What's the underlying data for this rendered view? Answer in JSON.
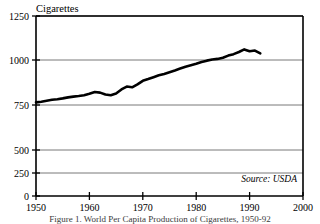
{
  "figure": {
    "title": "Cigarettes",
    "source_note": "Source: USDA",
    "caption": "Figure 1. World Per Capita Production of Cigarettes, 1950-92"
  },
  "chart_data": {
    "type": "line",
    "title": "Cigarettes",
    "xlabel": "",
    "ylabel": "Cigarettes",
    "xlim": [
      1950,
      2000
    ],
    "ylim": [
      0,
      1250
    ],
    "grid": true,
    "legend": null,
    "annotations": [
      "Source: USDA"
    ],
    "xticks": [
      1950,
      1960,
      1970,
      1980,
      1990,
      2000
    ],
    "yticks": [
      0,
      250,
      500,
      750,
      1000,
      1250
    ],
    "series": [
      {
        "name": "Cigarettes per capita",
        "x": [
          1950,
          1951,
          1952,
          1953,
          1954,
          1955,
          1956,
          1957,
          1958,
          1959,
          1960,
          1961,
          1962,
          1963,
          1964,
          1965,
          1966,
          1967,
          1968,
          1969,
          1970,
          1971,
          1972,
          1973,
          1974,
          1975,
          1976,
          1977,
          1978,
          1979,
          1980,
          1981,
          1982,
          1983,
          1984,
          1985,
          1986,
          1987,
          1988,
          1989,
          1990,
          1991,
          1992
        ],
        "values": [
          650,
          655,
          662,
          668,
          672,
          678,
          685,
          690,
          694,
          700,
          710,
          722,
          718,
          705,
          700,
          712,
          740,
          760,
          755,
          775,
          800,
          812,
          825,
          838,
          848,
          860,
          872,
          885,
          898,
          908,
          918,
          930,
          940,
          948,
          952,
          960,
          975,
          985,
          1000,
          1018,
          1005,
          1010,
          990
        ]
      }
    ]
  },
  "axis_labels": {
    "y": [
      "1250",
      "1000",
      "750",
      "500",
      "250",
      "0"
    ],
    "x": [
      "1950",
      "1960",
      "1970",
      "1980",
      "1990",
      "2000"
    ]
  },
  "colors": {
    "line": "#000000",
    "grid": "#555555",
    "frame": "#000000",
    "background": "#ffffff",
    "text": "#000000"
  }
}
